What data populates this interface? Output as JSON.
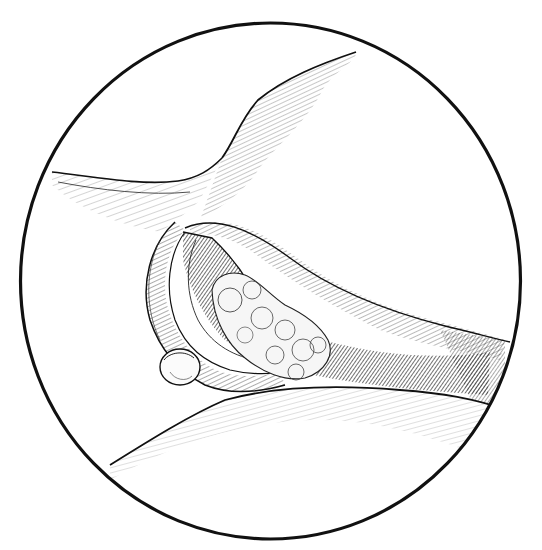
{
  "figure": {
    "type": "medical-illustration",
    "style": "pen-and-ink crosshatch line drawing",
    "frame": "circular",
    "caption": "",
    "colors": {
      "background": "#ffffff",
      "ink": "#111111",
      "hatch": "#333333",
      "dark_cavity": "#1a1a1a",
      "light_mass": "#f4f4f4"
    },
    "elements": [
      {
        "id": "circle-frame",
        "label": "circular frame"
      },
      {
        "id": "upper-fold",
        "label": "upper tissue fold"
      },
      {
        "id": "left-flap",
        "label": "left tissue flap"
      },
      {
        "id": "incision-lips",
        "label": "incision edges"
      },
      {
        "id": "cavity",
        "label": "dark cavity"
      },
      {
        "id": "lobulated-mass",
        "label": "lobulated mass"
      },
      {
        "id": "small-nodule",
        "label": "small rounded nodule"
      },
      {
        "id": "lower-surface",
        "label": "lower curved surface"
      }
    ]
  }
}
